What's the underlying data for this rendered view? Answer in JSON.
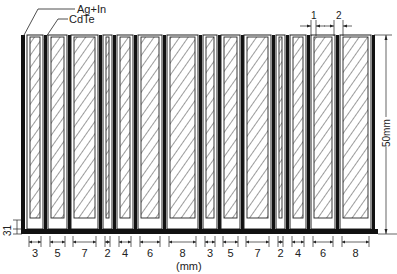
{
  "labels": {
    "electrode": "Ag+In",
    "semiconductor": "CdTe",
    "height_dim": "50mm",
    "unit": "(mm)",
    "gap_1": "1",
    "gap_2": "2",
    "bottom_dim": "31"
  },
  "strips": [
    {
      "width_label": "3",
      "x": 27,
      "w": 16
    },
    {
      "width_label": "5",
      "x": 48,
      "w": 19
    },
    {
      "width_label": "7",
      "x": 71,
      "w": 27
    },
    {
      "width_label": "2",
      "x": 103,
      "w": 9
    },
    {
      "width_label": "4",
      "x": 117,
      "w": 16
    },
    {
      "width_label": "6",
      "x": 138,
      "w": 24
    },
    {
      "width_label": "8",
      "x": 167,
      "w": 31
    },
    {
      "width_label": "3",
      "x": 203,
      "w": 14
    },
    {
      "width_label": "5",
      "x": 221,
      "w": 19
    },
    {
      "width_label": "7",
      "x": 244,
      "w": 27
    },
    {
      "width_label": "2",
      "x": 276,
      "w": 9
    },
    {
      "width_label": "4",
      "x": 290,
      "w": 16
    },
    {
      "width_label": "6",
      "x": 311,
      "w": 24
    },
    {
      "width_label": "8",
      "x": 340,
      "w": 31
    }
  ],
  "colors": {
    "ink": "#111111",
    "paper": "#ffffff"
  }
}
